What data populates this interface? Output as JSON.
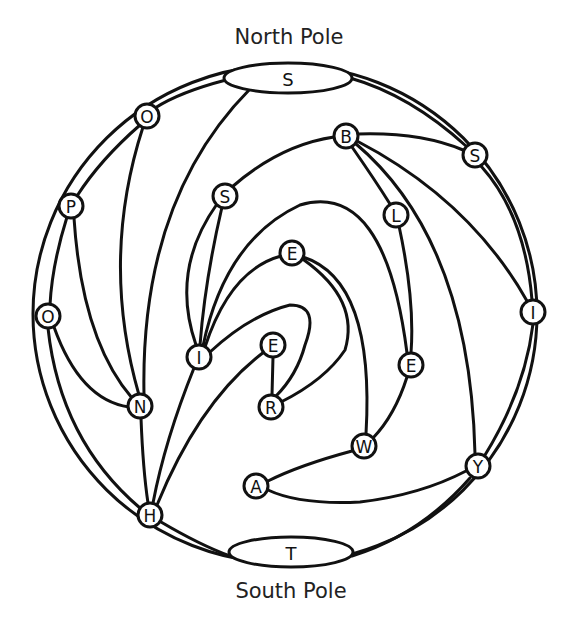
{
  "title_top": "North Pole",
  "title_bottom": "South Pole",
  "poles": {
    "north": {
      "letter": "S",
      "cx": 288,
      "cy": 78,
      "rx": 64,
      "ry": 15
    },
    "south": {
      "letter": "T",
      "cx": 291,
      "cy": 552,
      "rx": 62,
      "ry": 15
    }
  },
  "outer_circle": {
    "cx": 285,
    "cy": 314,
    "rx": 252,
    "ry": 249
  },
  "nodes": [
    {
      "id": "O1",
      "letter": "O",
      "x": 147,
      "y": 116
    },
    {
      "id": "P",
      "letter": "P",
      "x": 71,
      "y": 206
    },
    {
      "id": "O2",
      "letter": "O",
      "x": 48,
      "y": 316
    },
    {
      "id": "N",
      "letter": "N",
      "x": 140,
      "y": 406
    },
    {
      "id": "H",
      "letter": "H",
      "x": 150,
      "y": 515
    },
    {
      "id": "I1",
      "letter": "I",
      "x": 199,
      "y": 357
    },
    {
      "id": "S1",
      "letter": "S",
      "x": 225,
      "y": 196
    },
    {
      "id": "B",
      "letter": "B",
      "x": 346,
      "y": 136
    },
    {
      "id": "S2",
      "letter": "S",
      "x": 475,
      "y": 155
    },
    {
      "id": "L",
      "letter": "L",
      "x": 396,
      "y": 215
    },
    {
      "id": "E1",
      "letter": "E",
      "x": 292,
      "y": 253
    },
    {
      "id": "E2",
      "letter": "E",
      "x": 273,
      "y": 345
    },
    {
      "id": "R",
      "letter": "R",
      "x": 271,
      "y": 407
    },
    {
      "id": "E3",
      "letter": "E",
      "x": 411,
      "y": 365
    },
    {
      "id": "W",
      "letter": "W",
      "x": 364,
      "y": 446
    },
    {
      "id": "A",
      "letter": "A",
      "x": 256,
      "y": 486
    },
    {
      "id": "Y",
      "letter": "Y",
      "x": 478,
      "y": 466
    },
    {
      "id": "I2",
      "letter": "I",
      "x": 533,
      "y": 312
    }
  ],
  "edges": [
    {
      "from": "NorthPole",
      "to": "O1",
      "d": "M226,80 Q180,92 155,108"
    },
    {
      "from": "O1",
      "to": "P",
      "d": "M140,125 Q100,160 77,196"
    },
    {
      "from": "P",
      "to": "O2",
      "d": "M67,217 Q52,265 50,305"
    },
    {
      "from": "O2",
      "to": "H",
      "d": "M48,328 Q60,440 140,508"
    },
    {
      "from": "H",
      "to": "SouthPole",
      "d": "M161,522 Q200,545 230,556"
    },
    {
      "from": "SouthPole",
      "to": "Y",
      "d": "M352,556 Q420,535 470,478"
    },
    {
      "from": "Y",
      "to": "I2",
      "d": "M485,455 Q525,390 533,324"
    },
    {
      "from": "I2",
      "to": "S2",
      "d": "M532,300 Q525,215 481,166"
    },
    {
      "from": "S2",
      "to": "NorthPole",
      "d": "M466,146 Q410,95 350,78"
    },
    {
      "from": "O1",
      "to": "N",
      "d": "M143,127 Q100,260 139,395"
    },
    {
      "from": "P",
      "to": "N",
      "d": "M74,218 Q82,340 132,398"
    },
    {
      "from": "O2",
      "to": "N",
      "d": "M54,327 Q80,400 129,407"
    },
    {
      "from": "NorthPole",
      "to": "N",
      "d": "M250,89 Q140,200 144,395"
    },
    {
      "from": "N",
      "to": "H",
      "d": "M141,418 Q143,470 148,503"
    },
    {
      "from": "S1",
      "to": "I1",
      "d": "M222,207 Q205,280 200,345"
    },
    {
      "from": "S1",
      "to": "I1",
      "d": "M217,204 Q170,270 196,345"
    },
    {
      "from": "I1",
      "to": "H",
      "d": "M194,368 Q165,440 153,503"
    },
    {
      "from": "E2",
      "to": "H",
      "d": "M264,352 Q200,400 157,505"
    },
    {
      "from": "S1",
      "to": "B",
      "d": "M232,187 Q280,145 334,137"
    },
    {
      "from": "B",
      "to": "S2",
      "d": "M358,134 Q420,132 463,150"
    },
    {
      "from": "B",
      "to": "L",
      "d": "M352,147 Q375,180 390,204"
    },
    {
      "from": "B",
      "to": "Y",
      "d": "M355,143 Q470,240 475,454"
    },
    {
      "from": "B",
      "to": "I2",
      "d": "M357,141 Q470,200 527,301"
    },
    {
      "from": "L",
      "to": "E3",
      "d": "M399,226 Q415,300 411,353"
    },
    {
      "from": "I1",
      "to": "E3",
      "d": "M203,346 Q225,240 300,205 Q385,180 407,353"
    },
    {
      "from": "I1",
      "to": "E1",
      "d": "M205,347 Q230,270 281,256"
    },
    {
      "from": "E1",
      "to": "W",
      "d": "M303,257 Q375,280 366,434"
    },
    {
      "from": "E1",
      "to": "R",
      "d": "M304,260 Q360,300 345,350 Q325,380 281,402"
    },
    {
      "from": "I1",
      "to": "R",
      "d": "M210,352 Q250,315 290,305 Q320,305 305,345 Q297,375 276,396"
    },
    {
      "from": "E2",
      "to": "R",
      "d": "M273,357 L272,395"
    },
    {
      "from": "E3",
      "to": "W",
      "d": "M407,377 Q395,415 373,438"
    },
    {
      "from": "W",
      "to": "A",
      "d": "M352,451 Q300,465 268,481"
    },
    {
      "from": "A",
      "to": "Y",
      "d": "M268,490 Q300,505 360,502 Q420,495 466,471"
    }
  ]
}
